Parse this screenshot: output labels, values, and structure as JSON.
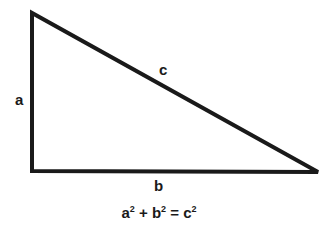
{
  "diagram": {
    "type": "right-triangle",
    "vertices": {
      "top_left": [
        32,
        13
      ],
      "bottom_left": [
        32,
        171
      ],
      "bottom_right": [
        318,
        172
      ]
    },
    "stroke_color": "#1a1a1a",
    "labels": {
      "a": "a",
      "b": "b",
      "c": "c"
    },
    "formula": {
      "a": "a",
      "b": "b",
      "c": "c",
      "exp": "2",
      "plus": "+",
      "equals": "="
    }
  }
}
